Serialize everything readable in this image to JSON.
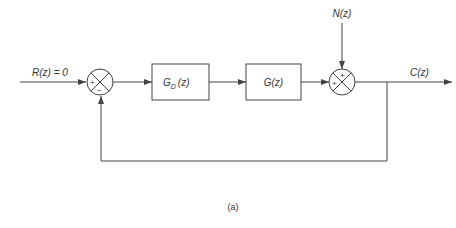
{
  "diagram": {
    "type": "block-diagram",
    "caption": "(a)",
    "colors": {
      "line": "#444444",
      "background": "#ffffff"
    },
    "inputs": {
      "reference": {
        "label": "R(z) = 0"
      },
      "disturbance": {
        "label": "N(z)"
      }
    },
    "output": {
      "label": "C(z)"
    },
    "blocks": [
      {
        "id": "controller",
        "label_main": "G",
        "label_sub": "D",
        "label_arg": "(z)"
      },
      {
        "id": "plant",
        "label": "G(z)"
      }
    ],
    "summing_junctions": [
      {
        "id": "sum1",
        "signs": {
          "left": "+",
          "bottom": "−"
        }
      },
      {
        "id": "sum2",
        "signs": {
          "top": "+",
          "left": "+"
        }
      }
    ],
    "connections": [
      "R(z) -> sum1 (+)",
      "sum1 -> G_D(z)",
      "G_D(z) -> G(z)",
      "G(z) -> sum2 (+)",
      "N(z) -> sum2 (+)",
      "sum2 -> C(z)",
      "C(z) -> feedback -> sum1 (−)"
    ]
  }
}
